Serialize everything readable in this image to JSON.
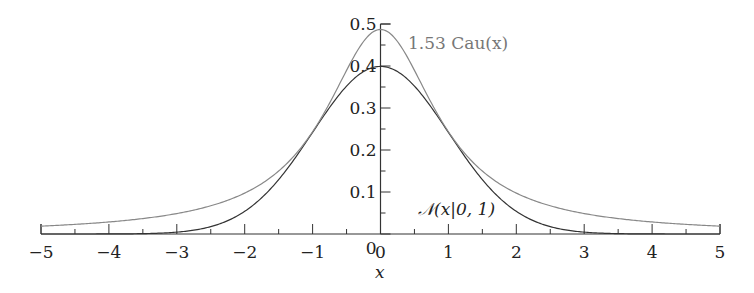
{
  "chart_data": {
    "type": "line",
    "title": "",
    "xlabel": "x",
    "ylabel": "",
    "xlim": [
      -5,
      5
    ],
    "ylim": [
      0,
      0.5
    ],
    "x_ticks": [
      "−5",
      "−4",
      "−3",
      "−2",
      "−1",
      "0",
      "1",
      "2",
      "3",
      "4",
      "5"
    ],
    "y_ticks": [
      "0",
      "0.1",
      "0.2",
      "0.3",
      "0.4",
      "0.5"
    ],
    "grid": false,
    "series": [
      {
        "name": "N(x|0,1)",
        "label": "𝒩(x|0, 1)",
        "color": "#333333",
        "formula": "exp(-x^2/2)/sqrt(2*pi)",
        "peak": 0.399
      },
      {
        "name": "1.53 Cau(x)",
        "label": "1.53 Cau(x)",
        "color": "#888888",
        "formula": "1.53/(pi*(1+x^2))",
        "peak": 0.487
      }
    ],
    "annotations": [
      {
        "text": "1.53 Cau(x)",
        "x": 0.85,
        "y": 0.46
      },
      {
        "text": "𝒩(x|0, 1)",
        "x": 1.1,
        "y": 0.04
      }
    ]
  },
  "labels": {
    "cauchy": "1.53 Cau(x)",
    "normal": "𝒩(x|0, 1)",
    "xaxis": "x"
  }
}
